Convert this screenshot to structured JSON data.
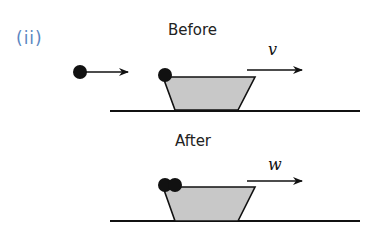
{
  "figure": {
    "part_label": "(ii)",
    "before": {
      "title": "Before",
      "velocity_label": "v",
      "objects": [
        {
          "name": "ball",
          "state": "moving toward cart"
        },
        {
          "name": "ball",
          "state": "resting on cart left edge"
        },
        {
          "name": "cart",
          "shape": "trapezoid",
          "fill": "#c8c8c8"
        }
      ]
    },
    "after": {
      "title": "After",
      "velocity_label": "w",
      "objects": [
        {
          "name": "two balls",
          "state": "both on cart left edge"
        },
        {
          "name": "cart",
          "shape": "trapezoid",
          "fill": "#c8c8c8"
        }
      ]
    },
    "colors": {
      "part_label": "#5b86c2",
      "cart_fill": "#c8c8c8",
      "ink": "#111111"
    }
  }
}
